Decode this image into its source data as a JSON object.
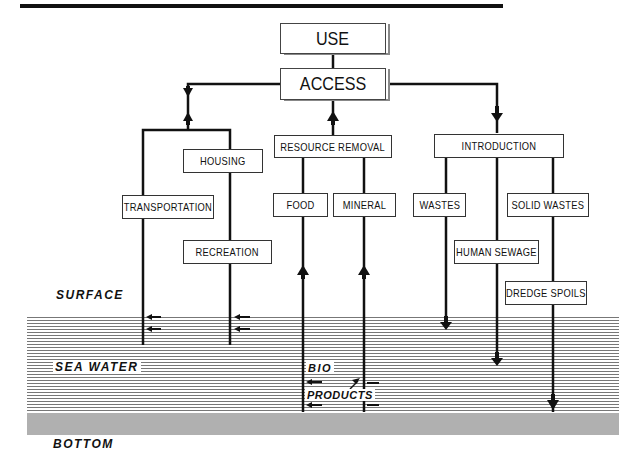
{
  "diagram": {
    "nodes": {
      "use": "USE",
      "access": "ACCESS",
      "housing": "HOUSING",
      "transportation": "TRANSPORTATION",
      "recreation": "RECREATION",
      "resource_removal": "RESOURCE REMOVAL",
      "food": "FOOD",
      "mineral": "MINERAL",
      "introduction": "INTRODUCTION",
      "wastes": "WASTES",
      "solid_wastes": "SOLID WASTES",
      "human_sewage": "HUMAN SEWAGE",
      "dredge_spoils": "DREDGE SPOILS"
    },
    "zones": {
      "surface": "SURFACE",
      "sea_water": "SEA WATER",
      "bottom": "BOTTOM"
    },
    "annotations": {
      "bio": "BIO",
      "products": "PRODUCTS"
    },
    "colors": {
      "line": "#111111",
      "water": "#777777",
      "bottom": "#d8d8d8"
    }
  }
}
